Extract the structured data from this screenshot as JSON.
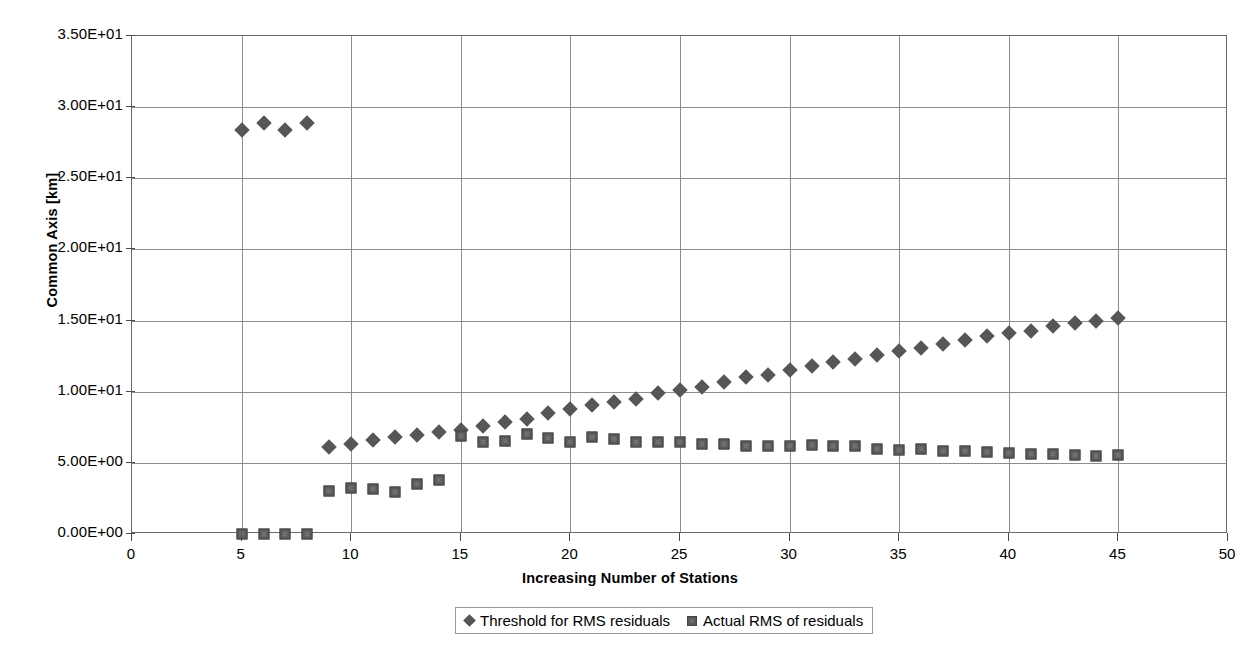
{
  "chart_data": {
    "type": "scatter",
    "title": "",
    "xlabel": "Increasing Number of Stations",
    "ylabel": "Common Axis [km]",
    "xlim": [
      0,
      50
    ],
    "ylim": [
      0,
      35
    ],
    "grid": true,
    "legend_position": "bottom",
    "x_tick_labels": [
      "0",
      "5",
      "10",
      "15",
      "20",
      "25",
      "30",
      "35",
      "40",
      "45",
      "50"
    ],
    "x_tick_values": [
      0,
      5,
      10,
      15,
      20,
      25,
      30,
      35,
      40,
      45,
      50
    ],
    "y_tick_labels": [
      "0.00E+00",
      "5.00E+00",
      "1.00E+01",
      "1.50E+01",
      "2.00E+01",
      "2.50E+01",
      "3.00E+01",
      "3.50E+01"
    ],
    "y_tick_values": [
      0,
      5,
      10,
      15,
      20,
      25,
      30,
      35
    ],
    "marker_color": "#565656",
    "gridline_color": "#8d8d8d",
    "series": [
      {
        "name": "Threshold for RMS residuals",
        "marker": "diamond",
        "color": "#565656",
        "x": [
          5,
          6,
          7,
          8,
          9,
          10,
          11,
          12,
          13,
          14,
          15,
          16,
          17,
          18,
          19,
          20,
          21,
          22,
          23,
          24,
          25,
          26,
          27,
          28,
          29,
          30,
          31,
          32,
          33,
          34,
          35,
          36,
          37,
          38,
          39,
          40,
          41,
          42,
          43,
          44,
          45
        ],
        "values": [
          28.4,
          28.9,
          28.4,
          28.9,
          6.1,
          6.35,
          6.6,
          6.85,
          6.95,
          7.15,
          7.3,
          7.6,
          7.85,
          8.1,
          8.5,
          8.8,
          9.1,
          9.3,
          9.5,
          9.9,
          10.1,
          10.35,
          10.7,
          11.0,
          11.2,
          11.5,
          11.8,
          12.1,
          12.3,
          12.6,
          12.85,
          13.1,
          13.35,
          13.6,
          13.9,
          14.1,
          14.3,
          14.6,
          14.8,
          15.0,
          15.2
        ]
      },
      {
        "name": "Actual RMS of residuals",
        "marker": "square",
        "color": "#5a5a5a",
        "x": [
          5,
          6,
          7,
          8,
          9,
          10,
          11,
          12,
          13,
          14,
          15,
          16,
          17,
          18,
          19,
          20,
          21,
          22,
          23,
          24,
          25,
          26,
          27,
          28,
          29,
          30,
          31,
          32,
          33,
          34,
          35,
          36,
          37,
          38,
          39,
          40,
          41,
          42,
          43,
          44,
          45
        ],
        "values": [
          0.0,
          0.0,
          0.0,
          0.0,
          3.05,
          3.2,
          3.15,
          2.95,
          3.5,
          3.8,
          6.9,
          6.5,
          6.55,
          7.0,
          6.75,
          6.45,
          6.8,
          6.7,
          6.5,
          6.45,
          6.45,
          6.35,
          6.3,
          6.2,
          6.15,
          6.2,
          6.25,
          6.2,
          6.15,
          6.0,
          5.9,
          5.95,
          5.85,
          5.8,
          5.75,
          5.7,
          5.65,
          5.6,
          5.55,
          5.5,
          5.55
        ]
      }
    ]
  },
  "legend": {
    "entries": [
      {
        "label": "Threshold for RMS residuals",
        "marker": "diamond"
      },
      {
        "label": "Actual RMS of residuals",
        "marker": "square"
      }
    ]
  }
}
